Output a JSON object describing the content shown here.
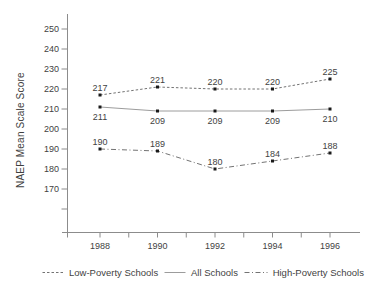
{
  "chart_data": {
    "type": "line",
    "title": "",
    "xlabel": "",
    "ylabel": "NAEP Mean Scale Score",
    "x": [
      1988,
      1990,
      1992,
      1994,
      1996
    ],
    "series": [
      {
        "name": "Low-Poverty Schools",
        "values": [
          217,
          221,
          220,
          220,
          225
        ],
        "line_style": "dashed",
        "dash": "2.5 2",
        "color": "#737373",
        "label_position": "above"
      },
      {
        "name": "All Schools",
        "values": [
          211,
          209,
          209,
          209,
          210
        ],
        "line_style": "solid",
        "dash": "",
        "color": "#9c9c9c",
        "label_position": "below"
      },
      {
        "name": "High-Poverty Schools",
        "values": [
          190,
          189,
          180,
          184,
          188
        ],
        "line_style": "dash-dot",
        "dash": "5 2.5 1 2.5",
        "color": "#737373",
        "label_position": "above"
      }
    ],
    "y_axis": {
      "tick_labels": [
        250,
        240,
        230,
        220,
        210,
        200,
        190,
        180,
        170
      ],
      "unlabeled_ticks": [
        160
      ],
      "tick_step": 10
    },
    "x_axis": {
      "tick_years": [
        1988,
        1989,
        1990,
        1991,
        1992,
        1993,
        1994,
        1995,
        1996
      ],
      "label_years": [
        1988,
        1990,
        1992,
        1994,
        1996
      ]
    },
    "marker": "square",
    "marker_color": "#1a1a1a",
    "axis_color": "#8c8c8c",
    "text_color": "#3f3f3f",
    "grid": false,
    "legend_position": "bottom"
  }
}
